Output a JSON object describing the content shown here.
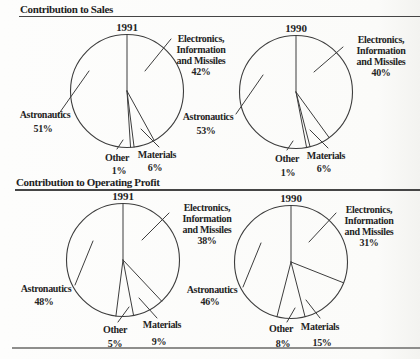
{
  "sections": {
    "sales": {
      "title": "Contribution to Sales"
    },
    "profit": {
      "title": "Contribution to Operating Profit"
    }
  },
  "colors": {
    "text": "#242424",
    "chart_line": "#3d3d3d",
    "rule_dark": "#454545",
    "rule_light": "#8e8e8c",
    "background": "#fbfbf9"
  },
  "chart_data": [
    {
      "type": "pie",
      "section": "Contribution to Sales",
      "year": "1991",
      "unit": "%",
      "slice_order": "clockwise from 12 o'clock",
      "slices": [
        {
          "name": "Electronics, Information and Missiles",
          "label_lines": [
            "Electronics,",
            "Information",
            "and Missiles"
          ],
          "pct_label": "42%",
          "value": 42
        },
        {
          "name": "Materials",
          "label_lines": [
            "Materials"
          ],
          "pct_label": "6%",
          "value": 6
        },
        {
          "name": "Other",
          "label_lines": [
            "Other"
          ],
          "pct_label": "1%",
          "value": 1
        },
        {
          "name": "Astronautics",
          "label_lines": [
            "Astronautics"
          ],
          "pct_label": "51%",
          "value": 51
        }
      ]
    },
    {
      "type": "pie",
      "section": "Contribution to Sales",
      "year": "1990",
      "unit": "%",
      "slice_order": "clockwise from 12 o'clock",
      "slices": [
        {
          "name": "Electronics, Information and Missiles",
          "label_lines": [
            "Electronics,",
            "Information",
            "and Missiles"
          ],
          "pct_label": "40%",
          "value": 40
        },
        {
          "name": "Materials",
          "label_lines": [
            "Materials"
          ],
          "pct_label": "6%",
          "value": 6
        },
        {
          "name": "Other",
          "label_lines": [
            "Other"
          ],
          "pct_label": "1%",
          "value": 1
        },
        {
          "name": "Astronautics",
          "label_lines": [
            "Astronautics"
          ],
          "pct_label": "53%",
          "value": 53
        }
      ]
    },
    {
      "type": "pie",
      "section": "Contribution to Operating Profit",
      "year": "1991",
      "unit": "%",
      "slice_order": "clockwise from 12 o'clock",
      "slices": [
        {
          "name": "Electronics, Information and Missiles",
          "label_lines": [
            "Electronics,",
            "Information",
            "and Missiles"
          ],
          "pct_label": "38%",
          "value": 38
        },
        {
          "name": "Materials",
          "label_lines": [
            "Materials"
          ],
          "pct_label": "9%",
          "value": 9
        },
        {
          "name": "Other",
          "label_lines": [
            "Other"
          ],
          "pct_label": "5%",
          "value": 5
        },
        {
          "name": "Astronautics",
          "label_lines": [
            "Astronautics"
          ],
          "pct_label": "48%",
          "value": 48
        }
      ]
    },
    {
      "type": "pie",
      "section": "Contribution to Operating Profit",
      "year": "1990",
      "unit": "%",
      "slice_order": "clockwise from 12 o'clock",
      "slices": [
        {
          "name": "Electronics, Information and Missiles",
          "label_lines": [
            "Electronics,",
            "Information",
            "and Missiles"
          ],
          "pct_label": "31%",
          "value": 31
        },
        {
          "name": "Materials",
          "label_lines": [
            "Materials"
          ],
          "pct_label": "15%",
          "value": 15
        },
        {
          "name": "Other",
          "label_lines": [
            "Other"
          ],
          "pct_label": "8%",
          "value": 8
        },
        {
          "name": "Astronautics",
          "label_lines": [
            "Astronautics"
          ],
          "pct_label": "46%",
          "value": 46
        }
      ]
    }
  ]
}
